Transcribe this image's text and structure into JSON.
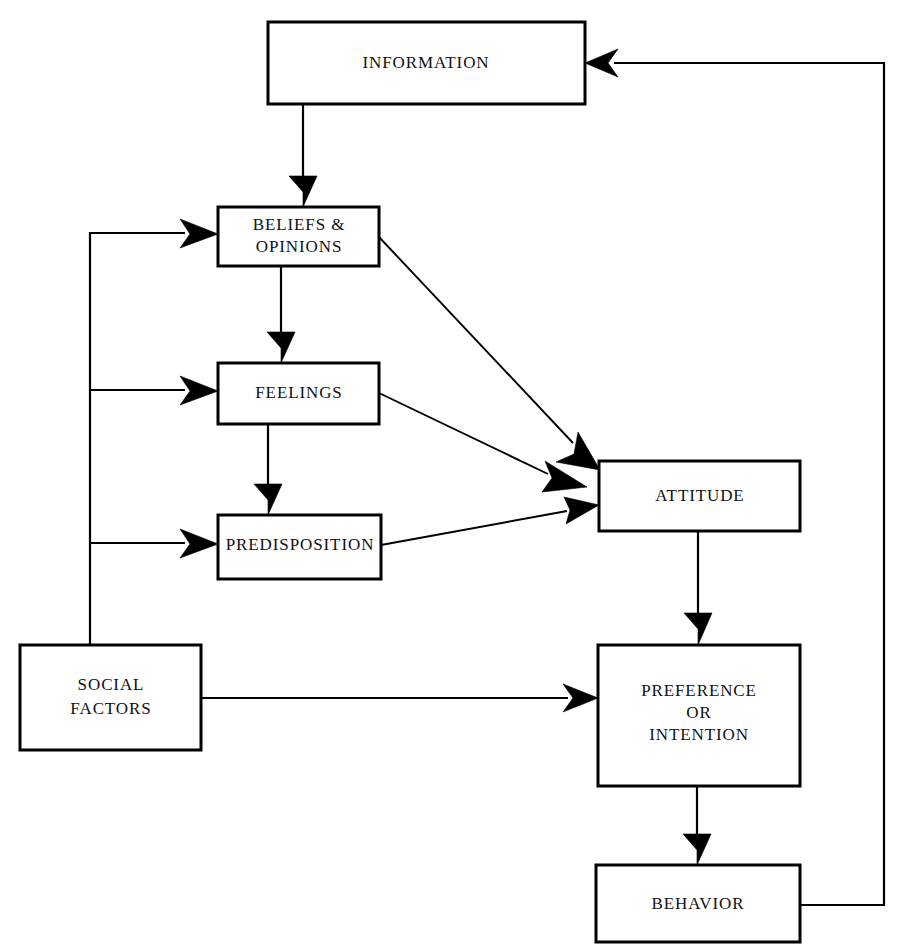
{
  "diagram": {
    "background_color": "#ffffff",
    "line_color": "#000000",
    "text_color": "#111111",
    "nodes": {
      "information": {
        "label": "INFORMATION",
        "x": 268,
        "y": 22,
        "w": 317,
        "h": 82
      },
      "beliefs": {
        "label_line1": "BELIEFS &",
        "label_line2": "OPINIONS",
        "x": 218,
        "y": 207,
        "w": 161,
        "h": 59
      },
      "feelings": {
        "label": "FEELINGS",
        "x": 218,
        "y": 363,
        "w": 161,
        "h": 61
      },
      "predisposition": {
        "label": "PREDISPOSITION",
        "x": 218,
        "y": 515,
        "w": 163,
        "h": 64
      },
      "social_factors": {
        "label_line1": "SOCIAL",
        "label_line2": "FACTORS",
        "x": 20,
        "y": 645,
        "w": 181,
        "h": 105
      },
      "attitude": {
        "label": "ATTITUDE",
        "x": 599,
        "y": 461,
        "w": 201,
        "h": 70
      },
      "preference": {
        "label_line1": "PREFERENCE",
        "label_line2": "OR",
        "label_line3": "INTENTION",
        "x": 598,
        "y": 645,
        "w": 202,
        "h": 141
      },
      "behavior": {
        "label": "BEHAVIOR",
        "x": 596,
        "y": 865,
        "w": 204,
        "h": 77
      }
    },
    "edges": [
      {
        "name": "information-to-beliefs",
        "from": "information",
        "to": "beliefs",
        "kind": "vertical-arrow"
      },
      {
        "name": "beliefs-to-feelings",
        "from": "beliefs",
        "to": "feelings",
        "kind": "vertical-arrow"
      },
      {
        "name": "feelings-to-predisposition",
        "from": "feelings",
        "to": "predisposition",
        "kind": "vertical-arrow"
      },
      {
        "name": "beliefs-to-attitude",
        "from": "beliefs",
        "to": "attitude",
        "kind": "diagonal-arrow"
      },
      {
        "name": "feelings-to-attitude",
        "from": "feelings",
        "to": "attitude",
        "kind": "diagonal-arrow"
      },
      {
        "name": "predisposition-to-attitude",
        "from": "predisposition",
        "to": "attitude",
        "kind": "diagonal-arrow"
      },
      {
        "name": "attitude-to-preference",
        "from": "attitude",
        "to": "preference",
        "kind": "vertical-arrow"
      },
      {
        "name": "preference-to-behavior",
        "from": "preference",
        "to": "behavior",
        "kind": "vertical-arrow"
      },
      {
        "name": "social-factors-to-beliefs",
        "from": "social_factors",
        "to": "beliefs",
        "kind": "elbow-arrow"
      },
      {
        "name": "social-factors-to-feelings",
        "from": "social_factors",
        "to": "feelings",
        "kind": "elbow-arrow"
      },
      {
        "name": "social-factors-to-predisposition",
        "from": "social_factors",
        "to": "predisposition",
        "kind": "elbow-arrow"
      },
      {
        "name": "social-factors-to-preference",
        "from": "social_factors",
        "to": "preference",
        "kind": "horizontal-arrow"
      },
      {
        "name": "behavior-to-information-feedback",
        "from": "behavior",
        "to": "information",
        "kind": "feedback-loop-arrow"
      }
    ]
  }
}
